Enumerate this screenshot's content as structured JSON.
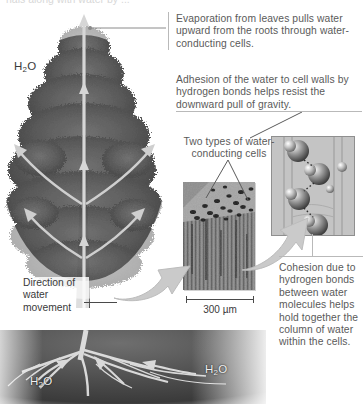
{
  "figure": {
    "caption_remnant": "rials along with water by ...",
    "background_color": "#ffffff",
    "text_color": "#5a5a5a"
  },
  "notes": {
    "evaporation": "Evaporation from leaves pulls water upward from the roots through water-conducting cells.",
    "adhesion": "Adhesion of the water to cell walls by hydrogen bonds helps resist the downward pull of gravity.",
    "cohesion": "Cohesion due to hydrogen bonds between water molecules helps hold together the column of water within the cells.",
    "two_types": "Two types of water-conducting cells",
    "direction": "Direction of water movement"
  },
  "labels": {
    "h2o_canopy": "H2O",
    "h2o_root_left": "H2O",
    "h2o_root_right": "H2O",
    "scale_bar": "300 µm"
  },
  "icons": {
    "transition_arrow_1": "curved-block-arrow-icon",
    "transition_arrow_2": "curved-block-arrow-icon",
    "upward_flow_arrow": "up-arrow-icon",
    "evaporation_arrows": "diverging-arrows-icon",
    "hydrogen_bond": "dotted-bond-icon"
  },
  "colors": {
    "soil": "#4e4e4e",
    "foliage": "#5c5c5c",
    "arrow_gray": "#bdbdbd",
    "rule": "#b9b9b9",
    "micrograph": "#8e8e8e",
    "molecule_panel": "#c9c9c9"
  }
}
